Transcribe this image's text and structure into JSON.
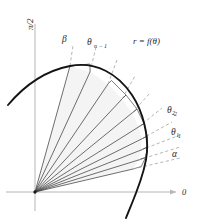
{
  "figure": {
    "title": ""
  },
  "axes": {
    "vertical_label": "π/2",
    "horizontal_label": "0",
    "origin_label": "",
    "x_axis_color": "#b0b0b0",
    "y_axis_color": "#b0b0b0"
  },
  "curve": {
    "label": "r = f(θ)",
    "color": "#1a1a1a",
    "equation_text": "r = f(θ)"
  },
  "rays": {
    "labels": [
      {
        "name": "alpha",
        "text": "α"
      },
      {
        "name": "theta-1",
        "text": "θ₁"
      },
      {
        "name": "theta-2",
        "text": "θ₂"
      },
      {
        "name": "theta-n-minus-1",
        "text": "θ"
      },
      {
        "name": "beta",
        "text": "β"
      }
    ],
    "theta_n_minus_1_subscript": "n − 1",
    "theta_1_subscript": "1",
    "theta_2_subscript": "2",
    "dash_color": "#9a9a9a",
    "sector_line_color": "#4a4a4a",
    "fill_color": "#f2f2f2"
  },
  "colors": {
    "background": "#ffffff",
    "ink": "#1a1a1a",
    "light_ink": "#4a4a4a",
    "axis": "#b0b0b0",
    "fill": "#f2f2f2"
  }
}
